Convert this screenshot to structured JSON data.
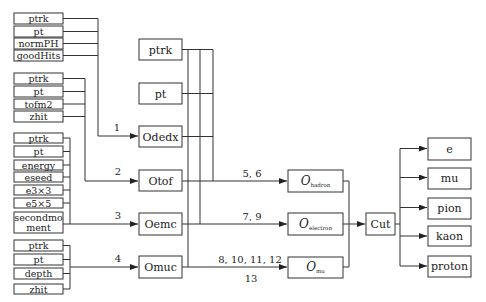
{
  "input_groups": [
    {
      "id": "g1",
      "label": "1",
      "items": [
        "ptrk",
        "pt",
        "normPH",
        "goodHits"
      ]
    },
    {
      "id": "g2",
      "label": "2",
      "items": [
        "ptrk",
        "pt",
        "tofm2",
        "zhit"
      ]
    },
    {
      "id": "g3",
      "label": "3",
      "items": [
        "ptrk",
        "pt",
        "energy",
        "eseed",
        "e3×3",
        "e5×5",
        "secondmo",
        "ment"
      ]
    },
    {
      "id": "g4",
      "label": "4",
      "items": [
        "ptrk",
        "pt",
        "depth",
        "zhit"
      ]
    }
  ],
  "shared_boxes": [
    "ptrk",
    "pt"
  ],
  "detector_boxes": [
    "Odedx",
    "Otof",
    "Oemc",
    "Omuc"
  ],
  "edge_labels": {
    "hadron": "5, 6",
    "electron": "7, 9",
    "mu_line1": "8, 10, 11, 12",
    "mu_line2": "13"
  },
  "combined_boxes": [
    {
      "main": "O",
      "sub": "hadron"
    },
    {
      "main": "O",
      "sub": "electron"
    },
    {
      "main": "O",
      "sub": "mu"
    }
  ],
  "cut_box": "Cut",
  "outputs": [
    "e",
    "mu",
    "pion",
    "kaon",
    "proton"
  ]
}
